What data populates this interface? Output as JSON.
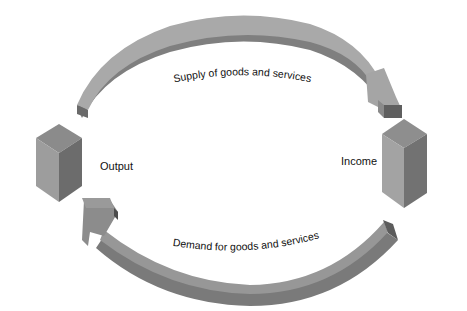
{
  "diagram": {
    "nodes": {
      "left": {
        "label": "Output"
      },
      "right": {
        "label": "Income"
      }
    },
    "flows": {
      "top": {
        "label": "Supply of goods and services",
        "direction": "Output → Income"
      },
      "bottom": {
        "label": "Demand for goods and services",
        "direction": "Income → Output"
      }
    },
    "colors": {
      "arrow_top_face": "#a9a9a9",
      "arrow_side": "#7b7b7b",
      "arrow_dark": "#5e5e5e",
      "cube_top": "#8a8a8a",
      "cube_left": "#9c9c9c",
      "cube_right": "#6e6e6e"
    }
  }
}
